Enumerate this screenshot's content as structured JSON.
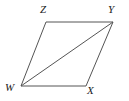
{
  "figure": {
    "name": "parallelogram-wxyz",
    "shape_type": "parallelogram with diagonal",
    "background_color": "#ffffff",
    "stroke_color": "#555555",
    "stroke_width": 1,
    "label_color": "#1a1a1a",
    "label_font_style": "italic serif",
    "label_font_size_px": 11,
    "vertices": [
      {
        "id": "W",
        "label": "W",
        "x": 21,
        "y": 86,
        "label_x": 5,
        "label_y": 82
      },
      {
        "id": "X",
        "label": "X",
        "x": 86,
        "y": 86,
        "label_x": 87,
        "label_y": 85
      },
      {
        "id": "Y",
        "label": "Y",
        "x": 113,
        "y": 22,
        "label_x": 108,
        "label_y": 4
      },
      {
        "id": "Z",
        "label": "Z",
        "x": 46,
        "y": 22,
        "label_x": 40,
        "label_y": 4
      }
    ],
    "edges": [
      {
        "id": "ZY",
        "label": "ZY",
        "from": "Z",
        "to": "Y",
        "kind": "side"
      },
      {
        "id": "YX",
        "label": "YX",
        "from": "Y",
        "to": "X",
        "kind": "side"
      },
      {
        "id": "XW",
        "label": "XW",
        "from": "X",
        "to": "W",
        "kind": "side"
      },
      {
        "id": "WZ",
        "label": "WZ",
        "from": "W",
        "to": "Z",
        "kind": "side"
      },
      {
        "id": "WY",
        "label": "WY",
        "from": "W",
        "to": "Y",
        "kind": "diagonal"
      }
    ],
    "outline_points": "46,22 113,22 86,86 21,86",
    "diagonal_points": "21,86 113,22"
  }
}
